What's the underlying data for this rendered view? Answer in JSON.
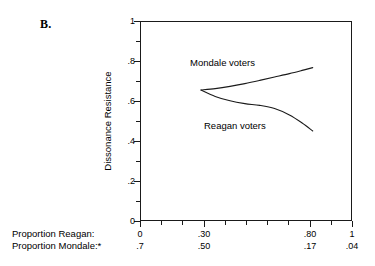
{
  "panel": {
    "label": "B."
  },
  "chart_data": {
    "type": "line",
    "title": "",
    "xlabel": "",
    "ylabel": "Dissonance Resistance",
    "xlim": [
      0,
      1
    ],
    "ylim": [
      0,
      1
    ],
    "grid": false,
    "legend_position": "inline-annotation",
    "y_axis": {
      "label": "Dissonance Resistance",
      "ticks": [
        0,
        0.2,
        0.4,
        0.6,
        0.8,
        1
      ],
      "tick_labels": [
        "0",
        ".2",
        ".4",
        ".6",
        ".8",
        "1"
      ],
      "minor_ticks": [
        0.1,
        0.3,
        0.5,
        0.7,
        0.9
      ]
    },
    "x_axis": {
      "rows": [
        {
          "title": "Proportion Reagan:",
          "ticks": [
            0,
            0.3,
            0.8,
            1
          ],
          "tick_labels": [
            "0",
            ".30",
            ".80",
            "1"
          ]
        },
        {
          "title": "Proportion Mondale:*",
          "ticks": [
            0,
            0.3,
            0.8,
            1
          ],
          "tick_labels": [
            ".7",
            ".50",
            ".17",
            ".04"
          ]
        }
      ],
      "minor_ticks": [
        0.1,
        0.2,
        0.4,
        0.5,
        0.6,
        0.7,
        0.9
      ]
    },
    "series": [
      {
        "name": "Mondale voters",
        "annotation": "Mondale voters",
        "color": "#1a1a1a",
        "x": [
          0.283,
          0.35,
          0.42,
          0.49,
          0.56,
          0.63,
          0.7,
          0.76,
          0.81
        ],
        "y": [
          0.66,
          0.667,
          0.678,
          0.692,
          0.708,
          0.725,
          0.742,
          0.758,
          0.772
        ]
      },
      {
        "name": "Reagan voters",
        "annotation": "Reagan voters",
        "color": "#1a1a1a",
        "x": [
          0.283,
          0.35,
          0.42,
          0.49,
          0.56,
          0.63,
          0.7,
          0.76,
          0.81
        ],
        "y": [
          0.66,
          0.628,
          0.606,
          0.592,
          0.583,
          0.567,
          0.535,
          0.495,
          0.455
        ]
      }
    ]
  }
}
